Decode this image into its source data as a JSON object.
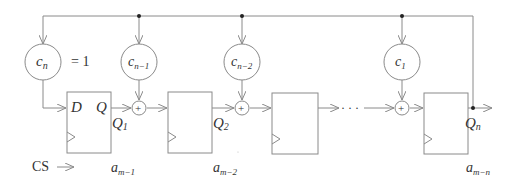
{
  "diagram": {
    "coefficients": [
      {
        "id": "cn",
        "main": "c",
        "sub": "n",
        "suffix": "= 1"
      },
      {
        "id": "cn1",
        "main": "c",
        "sub": "n−1"
      },
      {
        "id": "cn2",
        "main": "c",
        "sub": "n−2"
      },
      {
        "id": "c1",
        "main": "c",
        "sub": "1"
      }
    ],
    "flipflop_labels": {
      "d": "D",
      "q": "Q"
    },
    "outputs": [
      {
        "main": "Q",
        "sub": "1"
      },
      {
        "main": "Q",
        "sub": "2"
      },
      {
        "main": "Q",
        "sub": "n"
      }
    ],
    "sequence_labels": [
      {
        "main": "a",
        "sub": "m−1"
      },
      {
        "main": "a",
        "sub": "m−2"
      },
      {
        "main": "a",
        "sub": "m−n"
      }
    ],
    "clock_label": "CS",
    "adder_symbol": "+",
    "ellipsis": "· · ·",
    "colors": {
      "line": "#8a8a8a",
      "text": "#333333",
      "dot": "#222222"
    }
  }
}
